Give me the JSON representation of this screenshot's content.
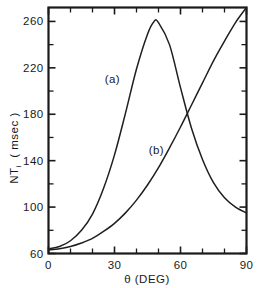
{
  "chart_data": {
    "type": "line",
    "title": "",
    "xlabel": "θ (DEG)",
    "ylabel_main": "NT",
    "ylabel_sub": "i",
    "ylabel_units": "( msec )",
    "xlim": [
      0,
      90
    ],
    "ylim": [
      60,
      272
    ],
    "grid": false,
    "legend_position": "inline-annotations",
    "xticks_major": [
      0,
      30,
      60,
      90
    ],
    "xticks_major_labels": [
      "0",
      "30",
      "60",
      "90"
    ],
    "xticks_minor": [
      10,
      20,
      40,
      50,
      70,
      80
    ],
    "yticks_major": [
      60,
      100,
      140,
      180,
      220,
      260
    ],
    "yticks_major_labels": [
      "60",
      "100",
      "140",
      "180",
      "220",
      "260"
    ],
    "yticks_minor": [
      80,
      120,
      160,
      200,
      240
    ],
    "series": [
      {
        "name": "(a)",
        "label": "(a)",
        "label_x_deg": 29,
        "label_y_msec": 207,
        "x": [
          0,
          5,
          10,
          15,
          20,
          25,
          30,
          35,
          40,
          45,
          48,
          50,
          55,
          60,
          65,
          70,
          75,
          80,
          85,
          90
        ],
        "values": [
          64,
          66,
          71,
          80,
          94,
          116,
          145,
          181,
          219,
          249,
          260,
          259,
          240,
          203,
          168,
          141,
          121,
          108,
          100,
          95
        ]
      },
      {
        "name": "(b)",
        "label": "(b)",
        "label_x_deg": 49,
        "label_y_msec": 146,
        "x": [
          0,
          5,
          10,
          15,
          20,
          25,
          30,
          35,
          40,
          45,
          50,
          55,
          60,
          65,
          70,
          75,
          80,
          85,
          90
        ],
        "values": [
          63,
          64,
          66,
          69,
          73,
          79,
          86,
          95,
          106,
          119,
          134,
          151,
          169,
          188,
          207,
          226,
          243,
          259,
          272
        ]
      }
    ],
    "annotations": [
      {
        "text": "(a)",
        "x_deg": 29,
        "y_msec": 207
      },
      {
        "text": "(b)",
        "x_deg": 49,
        "y_msec": 146
      }
    ],
    "colors": {
      "curve": "#1f1f1f",
      "axis": "#1a1a1a",
      "background": "#ffffff"
    }
  }
}
